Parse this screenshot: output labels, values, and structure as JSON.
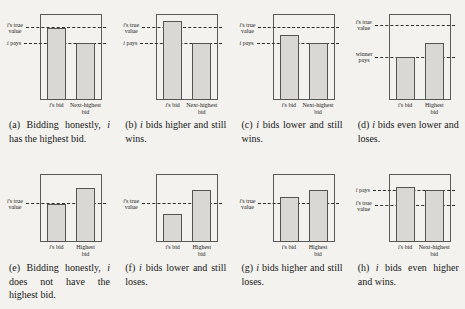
{
  "palette": {
    "background": "#f3f2ee",
    "bar_fill": "#d9d8d5",
    "bar_border": "#55544f",
    "box_border": "#5a5a58",
    "dashed_line": "#2e2e2c",
    "text": "#1c1c1c"
  },
  "chart_data": [
    {
      "id": "a",
      "type": "bar",
      "row": 1,
      "caption": "(a) Bidding honestly, i has the highest bid.",
      "categories": [
        "i's bid",
        "Next-highest bid"
      ],
      "category_lines": [
        [
          "i's bid"
        ],
        [
          "Next-highest",
          "bid"
        ]
      ],
      "values": [
        0.84,
        0.66
      ],
      "ylim": [
        0,
        1
      ],
      "reference_lines": [
        {
          "label": "i's true value",
          "label_lines": [
            "i's true",
            "value"
          ],
          "y": 0.84
        },
        {
          "label": "i pays",
          "label_lines": [
            "i pays"
          ],
          "y": 0.66
        }
      ]
    },
    {
      "id": "b",
      "type": "bar",
      "row": 1,
      "caption": "(b) i bids higher and still wins.",
      "categories": [
        "i's bid",
        "Next-highest bid"
      ],
      "category_lines": [
        [
          "i's bid"
        ],
        [
          "Next-highest",
          "bid"
        ]
      ],
      "values": [
        0.92,
        0.66
      ],
      "ylim": [
        0,
        1
      ],
      "reference_lines": [
        {
          "label": "i's true value",
          "label_lines": [
            "i's true",
            "value"
          ],
          "y": 0.84
        },
        {
          "label": "i pays",
          "label_lines": [
            "i pays"
          ],
          "y": 0.66
        }
      ]
    },
    {
      "id": "c",
      "type": "bar",
      "row": 1,
      "caption": "(c) i bids lower and still wins.",
      "categories": [
        "i's bid",
        "Next-highest bid"
      ],
      "category_lines": [
        [
          "i's bid"
        ],
        [
          "Next-highest",
          "bid"
        ]
      ],
      "values": [
        0.76,
        0.66
      ],
      "ylim": [
        0,
        1
      ],
      "reference_lines": [
        {
          "label": "i's true value",
          "label_lines": [
            "i's true",
            "value"
          ],
          "y": 0.84
        },
        {
          "label": "i pays",
          "label_lines": [
            "i pays"
          ],
          "y": 0.66
        }
      ]
    },
    {
      "id": "d",
      "type": "bar",
      "row": 1,
      "caption": "(d) i bids even lower and loses.",
      "categories": [
        "i's bid",
        "Highest bid"
      ],
      "category_lines": [
        [
          "i's bid"
        ],
        [
          "Highest",
          "bid"
        ]
      ],
      "values": [
        0.5,
        0.66
      ],
      "ylim": [
        0,
        1
      ],
      "reference_lines": [
        {
          "label": "i's true value",
          "label_lines": [
            "i's true",
            "value"
          ],
          "y": 0.87
        },
        {
          "label": "winner pays",
          "label_lines": [
            "winner",
            "pays"
          ],
          "y": 0.5
        }
      ]
    },
    {
      "id": "e",
      "type": "bar",
      "row": 2,
      "caption": "(e) Bidding honestly, i does not have the highest bid.",
      "categories": [
        "i's bid",
        "Highest bid"
      ],
      "category_lines": [
        [
          "i's bid"
        ],
        [
          "Highest",
          "bid"
        ]
      ],
      "values": [
        0.56,
        0.79
      ],
      "ylim": [
        0,
        1
      ],
      "reference_lines": [
        {
          "label": "i's true value",
          "label_lines": [
            "i's true",
            "value"
          ],
          "y": 0.56
        }
      ]
    },
    {
      "id": "f",
      "type": "bar",
      "row": 2,
      "caption": "(f) i bids lower and still loses.",
      "categories": [
        "i's bid",
        "Highest bid"
      ],
      "category_lines": [
        [
          "i's bid"
        ],
        [
          "Highest",
          "bid"
        ]
      ],
      "values": [
        0.41,
        0.77
      ],
      "ylim": [
        0,
        1
      ],
      "reference_lines": [
        {
          "label": "i's true value",
          "label_lines": [
            "i's true",
            "value"
          ],
          "y": 0.56
        }
      ]
    },
    {
      "id": "g",
      "type": "bar",
      "row": 2,
      "caption": "(g) i bids higher and still loses.",
      "categories": [
        "i's bid",
        "Highest bid"
      ],
      "category_lines": [
        [
          "i's bid"
        ],
        [
          "Highest",
          "bid"
        ]
      ],
      "values": [
        0.66,
        0.77
      ],
      "ylim": [
        0,
        1
      ],
      "reference_lines": [
        {
          "label": "i's true value",
          "label_lines": [
            "i's true",
            "value"
          ],
          "y": 0.56
        }
      ]
    },
    {
      "id": "h",
      "type": "bar",
      "row": 2,
      "caption": "(h) i bids even higher and wins.",
      "categories": [
        "i's bid",
        "Next-highest bid"
      ],
      "category_lines": [
        [
          "i's bid"
        ],
        [
          "Next-highest",
          "bid"
        ]
      ],
      "values": [
        0.81,
        0.76
      ],
      "ylim": [
        0,
        1
      ],
      "reference_lines": [
        {
          "label": "i pays",
          "label_lines": [
            "i pays"
          ],
          "y": 0.76
        },
        {
          "label": "i's true value",
          "label_lines": [
            "i's true",
            "value"
          ],
          "y": 0.53
        }
      ]
    }
  ]
}
